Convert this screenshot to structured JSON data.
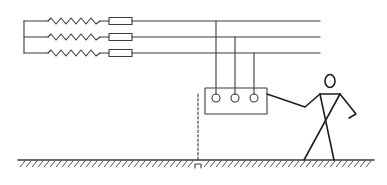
{
  "diagram": {
    "stroke_color": "#3a3a3a",
    "background": "#ffffff",
    "phases": [
      {
        "name": "phase-1",
        "y": 21,
        "drop_x": 216
      },
      {
        "name": "phase-2",
        "y": 37,
        "drop_x": 235
      },
      {
        "name": "phase-3",
        "y": 53,
        "drop_x": 254
      }
    ],
    "components": {
      "winding": "zigzag resistor/winding per phase",
      "fuse": "fuse per phase",
      "enclosure": "equipment casing with three terminals",
      "ground_path": "dashed line (no ground connection)",
      "person": "stick figure touching casing"
    }
  }
}
